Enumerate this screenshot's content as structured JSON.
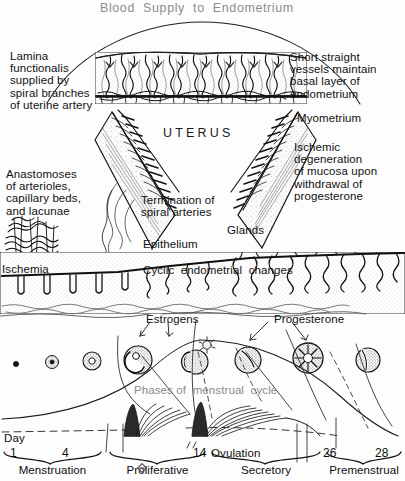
{
  "figure": {
    "title": "Blood  Supply  to  Endometrium",
    "center_label": "UTERUS",
    "background_color": "#fdfdfd",
    "ink_color": "#111111",
    "gray_text_color": "#8c8c8c"
  },
  "callouts": {
    "lamina_functionalis": "Lamina\nfunctionalis\nsupplied by\nspiral branches\nof uterine artery",
    "short_straight_vessels": "Short straight\nvessels maintain\nbasal layer of\nendometrium",
    "myometrium": "Myometrium",
    "ischemic_degeneration": "Ischemic\ndegeneration\nof mucosa upon\nwithdrawal of\nprogesterone",
    "anastomoses": "Anastomoses\nof arterioles,\ncapillary beds,\nand lacunae",
    "termination_spiral_arteries": "Termination of\nspiral arteries",
    "epithelium": "Epithelium",
    "glands": "Glands",
    "ischemia": "Ischemia",
    "cyclic_endometrial_changes": "Cyclic  endometrial  changes",
    "estrogens": "Estrogens",
    "progesterone": "Progesterone",
    "phases_of_menstrual_cycle": "Phases of  menstrual  cycle"
  },
  "timeline": {
    "day_label": "Day",
    "ticks": [
      {
        "value": "1",
        "x": 10
      },
      {
        "value": "4",
        "x": 62
      },
      {
        "value": "14",
        "x": 193
      },
      {
        "value": "26",
        "x": 323
      },
      {
        "value": "28",
        "x": 375
      }
    ],
    "ovulation_label": "Ovulation",
    "phases": [
      {
        "name": "Menstruation",
        "start": 4,
        "end": 101
      },
      {
        "name": "Proliferative",
        "start": 110,
        "end": 205
      },
      {
        "name": "Secretory",
        "start": 212,
        "end": 320
      },
      {
        "name": "Premenstrual",
        "start": 327,
        "end": 401
      }
    ],
    "marker_icon": "diamond-marker-icon"
  }
}
